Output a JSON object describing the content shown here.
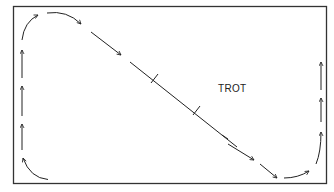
{
  "diagram": {
    "title_label": "TROT",
    "colors": {
      "line": "#222222",
      "border": "#333333",
      "background": "#ffffff"
    },
    "arena": {
      "x": 13,
      "y": 6,
      "width": 314,
      "height": 178
    }
  }
}
